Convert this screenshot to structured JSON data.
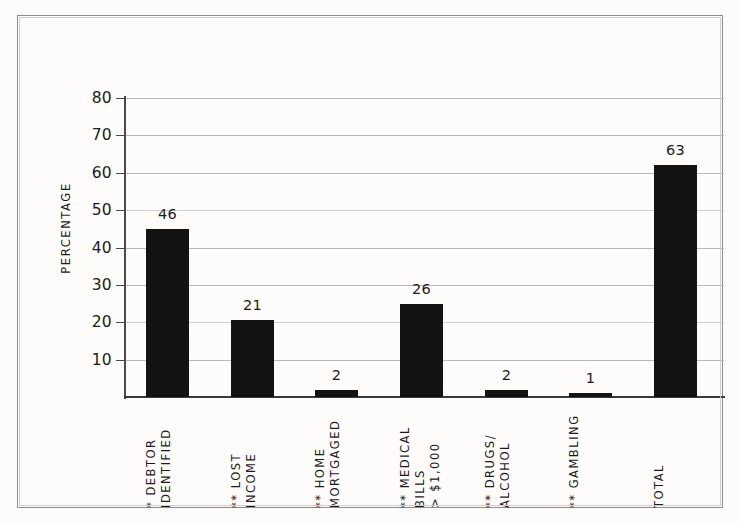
{
  "chart_data": {
    "type": "bar",
    "title": "",
    "subtitle": "",
    "xlabel": "",
    "ylabel": "PERCENTAGE",
    "ylim": [
      0,
      80
    ],
    "yticks": [
      10,
      20,
      30,
      40,
      50,
      60,
      70,
      80
    ],
    "grid": true,
    "legend": null,
    "bar_color": "#131313",
    "categories": [
      "* DEBTOR IDENTIFIED",
      "** LOST INCOME",
      "** HOME MORTGAGED",
      "** MEDICAL BILLS > $1,000",
      "** DRUGS/ALCOHOL",
      "** GAMBLING",
      "TOTAL"
    ],
    "category_lines": [
      [
        "* DEBTOR",
        "IDENTIFIED"
      ],
      [
        "** LOST",
        "INCOME"
      ],
      [
        "** HOME",
        "MORTGAGED"
      ],
      [
        "** MEDICAL",
        "BILLS",
        "> $1,000"
      ],
      [
        "** DRUGS/",
        "ALCOHOL"
      ],
      [
        "** GAMBLING"
      ],
      [
        "TOTAL"
      ]
    ],
    "values": [
      46,
      21,
      2,
      26,
      2,
      1,
      63
    ],
    "drawn_values": [
      45,
      20.7,
      2,
      25,
      2,
      1,
      62
    ],
    "value_labels": [
      "46",
      "21",
      "2",
      "26",
      "2",
      "1",
      "63"
    ]
  },
  "axis": {
    "y_tick_labels": [
      "80",
      "70",
      "60",
      "50",
      "40",
      "30",
      "20",
      "10"
    ],
    "y_axis_title": "PERCENTAGE"
  },
  "colors": {
    "bar": "#131313",
    "gridline": "#b9b9b9",
    "axis": "#3a3a3a",
    "frame": "#8d8d8d",
    "background": "#fdfcfa",
    "text": "#1b1b1b"
  }
}
